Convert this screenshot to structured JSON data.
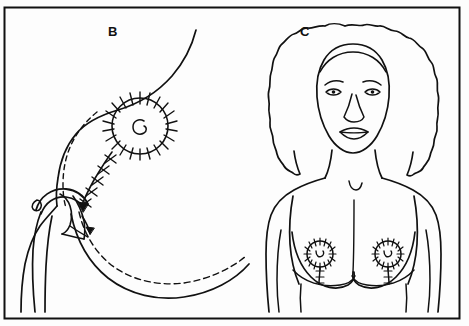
{
  "figure": {
    "background_color": "#fdfdfd",
    "ink_color": "#111111",
    "border": {
      "name": "figure-border",
      "x": 4,
      "y": 7,
      "width": 455,
      "height": 312,
      "stroke_width": 2
    },
    "panels": [
      {
        "id": "B",
        "label": "B",
        "label_x": 114,
        "label_y": 32,
        "caption": "Lateral oblique view of breast showing periareolar sutures, dashed planned incision line and flap rotation arrow",
        "view": "lateral-oblique",
        "elements": [
          "breast-contour",
          "dashed-incision-line",
          "sutured-areola",
          "vertical-suture-line",
          "rotation-arrow",
          "arm",
          "inframammary-dashed-curve"
        ]
      },
      {
        "id": "C",
        "label": "C",
        "label_x": 305,
        "label_y": 32,
        "caption": "Frontal view of female torso after surgery showing bilateral periareolar sutures and vertical lollipop scars",
        "view": "frontal-torso",
        "elements": [
          "head",
          "curly-hair",
          "face",
          "neck",
          "shoulders",
          "arms",
          "left-breast",
          "right-breast",
          "sutured-areola-left",
          "sutured-areola-right",
          "vertical-scar-left",
          "vertical-scar-right",
          "inframammary-fold-left",
          "inframammary-fold-right"
        ]
      }
    ],
    "areola_sutures": {
      "panel_b_tick_count": 20,
      "panel_c_tick_count": 16,
      "description": "Radial suture marks crossing the areolar circumference"
    }
  }
}
